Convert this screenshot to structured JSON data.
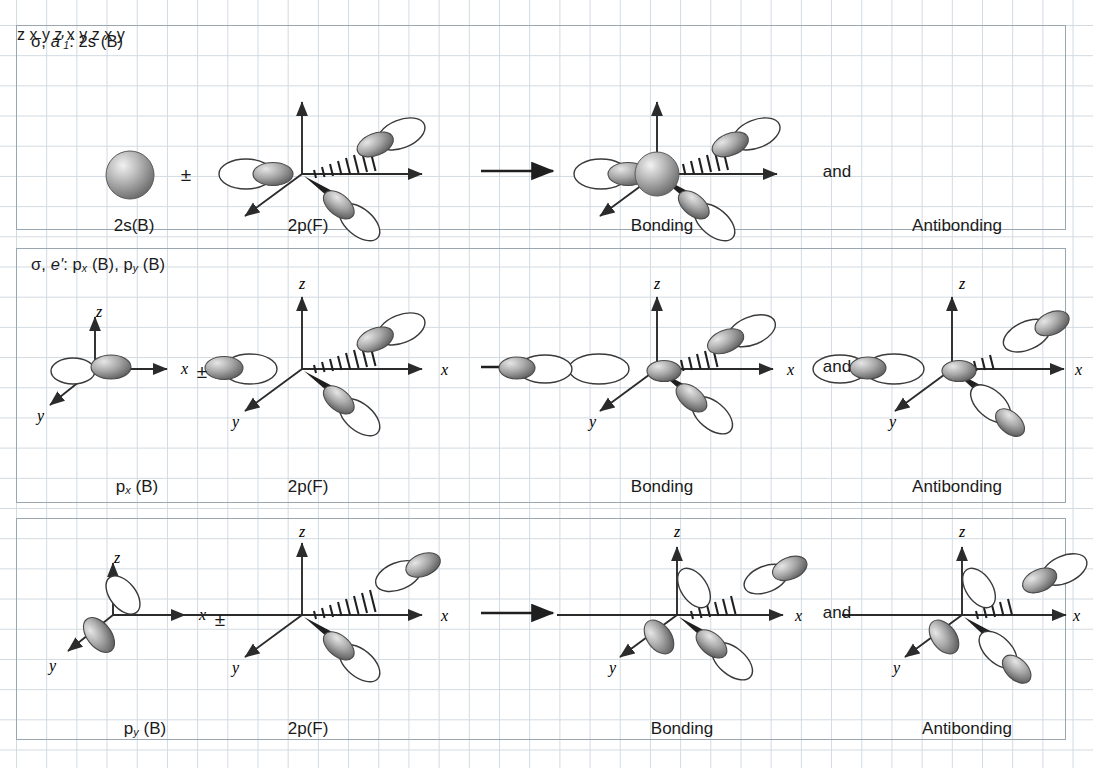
{
  "figure": {
    "grid_color": "#c9d4de",
    "frame_color": "#9aa6b0",
    "ink_color": "#1a1a1a",
    "lobe_fill_light": "#ffffff",
    "lobe_fill_shaded": "#8d8d8d",
    "sphere_color": "#9a9a9a"
  },
  "rows": [
    {
      "id": "row-1",
      "header": {
        "sigma": "σ,",
        "symmetry": "a'",
        "symmetry_sub": "1",
        "colon": ":",
        "orbital": "2s (B)"
      },
      "header_plain": "σ, a'1: 2s (B)",
      "operator": "±",
      "arrow": "→",
      "conjunction": "and",
      "captions": {
        "left": "2s(B)",
        "middle": "2p(F)",
        "bonding": "Bonding",
        "antibonding": "Antibonding"
      },
      "axes": {
        "z": "z",
        "x": "x",
        "y": "y"
      }
    },
    {
      "id": "row-2",
      "header": {
        "sigma": "σ,",
        "symmetry": "e'",
        "symmetry_sub": "",
        "colon": ":",
        "orbital": "p_x (B), p_y (B)"
      },
      "header_plain": "σ, e': px (B), py (B)",
      "operator": "±",
      "arrow": "→",
      "conjunction": "and",
      "captions": {
        "left": "p",
        "left_sub": "x",
        "left_tail": " (B)",
        "middle": "2p(F)",
        "bonding": "Bonding",
        "antibonding": "Antibonding"
      },
      "axes": {
        "z": "z",
        "x": "x",
        "y": "y"
      }
    },
    {
      "id": "row-3",
      "header": {
        "sigma": "",
        "symmetry": "",
        "symmetry_sub": "",
        "colon": "",
        "orbital": ""
      },
      "header_plain": "",
      "operator": "±",
      "arrow": "→",
      "conjunction": "and",
      "captions": {
        "left": "p",
        "left_sub": "y",
        "left_tail": " (B)",
        "middle": "2p(F)",
        "bonding": "Bonding",
        "antibonding": "Antibonding"
      },
      "axes": {
        "z": "z",
        "x": "x",
        "y": "y"
      }
    }
  ]
}
